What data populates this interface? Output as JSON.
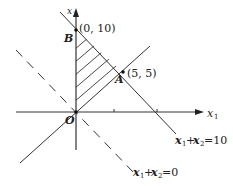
{
  "figure": {
    "type": "linear-programming-feasible-region",
    "axes": {
      "x_label": "x1",
      "y_label": "x2",
      "origin_label": "O",
      "x_tick_count": 2
    },
    "points": [
      {
        "name": "B",
        "coords_label": "(0, 10)",
        "x": 0,
        "y": 10
      },
      {
        "name": "A",
        "coords_label": "(5, 5)",
        "x": 5,
        "y": 5
      },
      {
        "name": "O",
        "x": 0,
        "y": 0
      }
    ],
    "lines": [
      {
        "equation": "x1+x2=10",
        "style": "solid"
      },
      {
        "equation": "x1+x2=0",
        "style": "dashed"
      },
      {
        "equation": "x2=x1",
        "style": "solid"
      }
    ],
    "shaded_region": "triangle O-B-A",
    "labels": {
      "B_letter": "B",
      "B_coords": "(0, 10)",
      "A_letter": "A",
      "A_coords": "(5, 5)",
      "origin": "O",
      "x1_axis": "x",
      "x1_sub": "1",
      "x2_axis": "x",
      "x2_sub": "2",
      "line10_a": "x",
      "line10_sub1": "1",
      "line10_plus": "+",
      "line10_b": "x",
      "line10_sub2": "2",
      "line10_rhs": "=10",
      "line0_a": "x",
      "line0_sub1": "1",
      "line0_plus": "+",
      "line0_b": "x",
      "line0_sub2": "2",
      "line0_rhs": "=0"
    }
  }
}
